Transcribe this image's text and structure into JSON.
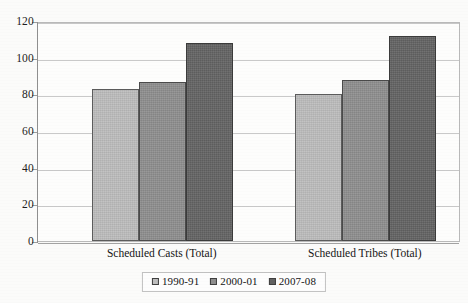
{
  "chart_data": {
    "type": "bar",
    "title": "",
    "subtitle": "",
    "xlabel": "",
    "ylabel": "",
    "categories": [
      "Scheduled Casts (Total)",
      "Scheduled Tribes (Total)"
    ],
    "series": [
      {
        "name": "1990-91",
        "color": "#bdbdbd",
        "values": [
          83,
          80
        ]
      },
      {
        "name": "2000-01",
        "color": "#8e8e8e",
        "values": [
          87,
          88
        ]
      },
      {
        "name": "2007-08",
        "color": "#636363",
        "values": [
          108,
          112
        ]
      }
    ],
    "ylim": [
      0,
      120
    ],
    "ytick_step": 20,
    "yticks": [
      0,
      20,
      40,
      60,
      80,
      100,
      120
    ],
    "ytick_labels": [
      "0",
      "20",
      "40",
      "60",
      "80",
      "100",
      "120"
    ],
    "grid": true,
    "grid_axis": "y",
    "legend": true,
    "legend_position": "bottom-center",
    "legend_entries": [
      "1990-91",
      "2000-01",
      "2007-08"
    ],
    "bar_border_color": "#4a4a4a",
    "plot_background": "#fdfdfc",
    "gridline_color": "#c9c9c9"
  }
}
